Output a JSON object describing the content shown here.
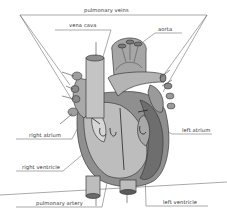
{
  "diagram": {
    "labels": {
      "pulmonary_veins": "pulmonary veins",
      "vena_cava": "vena cava",
      "aorta": "aorta",
      "right_atrium": "right atrium",
      "left_atrium": "left atrium",
      "right_ventricle": "right ventricle",
      "pulmonary_artery": "pulmonary artery",
      "left_ventricle": "left ventricle"
    },
    "colors": {
      "background": "#ffffff",
      "leader_line": "#555555",
      "tissue_light": "#c8c8c8",
      "tissue_mid": "#9a9a9a",
      "tissue_dark": "#6e6e6e",
      "outline": "#3a3a3a"
    }
  }
}
